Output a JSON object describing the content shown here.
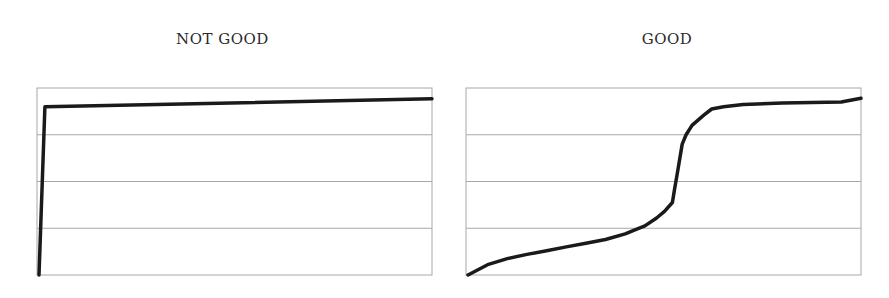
{
  "chart_data": [
    {
      "type": "line",
      "title": "NOT GOOD",
      "xlabel": "",
      "ylabel": "",
      "grid": true,
      "gridlines_y": 4,
      "ylim": [
        0,
        4
      ],
      "legend": "none",
      "axis_tick_labels": "none",
      "line_color": "#1a1a1a",
      "points": [
        [
          0,
          0.0
        ],
        [
          0.015,
          3.6
        ],
        [
          1.0,
          3.77
        ]
      ]
    },
    {
      "type": "line",
      "title": "GOOD",
      "xlabel": "",
      "ylabel": "",
      "grid": true,
      "gridlines_y": 4,
      "ylim": [
        0,
        4
      ],
      "legend": "none",
      "axis_tick_labels": "none",
      "line_color": "#1a1a1a",
      "points": [
        [
          0,
          0.0
        ],
        [
          0.05,
          0.22
        ],
        [
          0.1,
          0.35
        ],
        [
          0.15,
          0.44
        ],
        [
          0.2,
          0.52
        ],
        [
          0.25,
          0.6
        ],
        [
          0.3,
          0.68
        ],
        [
          0.35,
          0.76
        ],
        [
          0.4,
          0.88
        ],
        [
          0.42,
          0.95
        ],
        [
          0.45,
          1.05
        ],
        [
          0.48,
          1.22
        ],
        [
          0.5,
          1.36
        ],
        [
          0.52,
          1.55
        ],
        [
          0.525,
          1.8
        ],
        [
          0.535,
          2.3
        ],
        [
          0.545,
          2.8
        ],
        [
          0.555,
          3.0
        ],
        [
          0.57,
          3.2
        ],
        [
          0.6,
          3.42
        ],
        [
          0.62,
          3.55
        ],
        [
          0.65,
          3.6
        ],
        [
          0.7,
          3.65
        ],
        [
          0.8,
          3.68
        ],
        [
          0.95,
          3.7
        ],
        [
          1.0,
          3.78
        ]
      ]
    }
  ]
}
